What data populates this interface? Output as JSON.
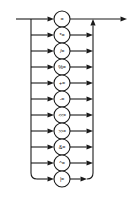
{
  "diagram": {
    "type": "railroad-syntax-diagram",
    "name": "assignment-operator",
    "geometry": {
      "width": 131,
      "height": 208,
      "entry_x": 16,
      "left_rail_x": 31,
      "node_center_x": 62,
      "node_radius": 8,
      "right_rail_x": 93,
      "exit_x": 127,
      "main_line_y": 19,
      "row_spacing": 16,
      "first_row_y": 19,
      "corner_radius": 6
    },
    "colors": {
      "background": "#ffffff",
      "line": "#1a1a1a",
      "node_fill": "#ffffff",
      "node_stroke": "#1a1a1a",
      "text": "#111111"
    },
    "entry_arrow": "arrow-right",
    "exit_arrow": "arrow-right",
    "merge_arrow": "arrow-up",
    "options": [
      {
        "label": "=",
        "row": 0,
        "y": 19,
        "wide": false
      },
      {
        "label": "*=",
        "row": 1,
        "y": 35,
        "wide": false
      },
      {
        "label": "/=",
        "row": 2,
        "y": 51,
        "wide": false
      },
      {
        "label": "%=",
        "row": 3,
        "y": 67,
        "wide": false
      },
      {
        "label": "+=",
        "row": 4,
        "y": 83,
        "wide": false
      },
      {
        "label": "-=",
        "row": 5,
        "y": 99,
        "wide": false
      },
      {
        "label": "<<=",
        "row": 6,
        "y": 115,
        "wide": true
      },
      {
        "label": ">>=",
        "row": 7,
        "y": 131,
        "wide": true
      },
      {
        "label": "&=",
        "row": 8,
        "y": 147,
        "wide": false
      },
      {
        "label": "^=",
        "row": 9,
        "y": 163,
        "wide": false
      },
      {
        "label": "|=",
        "row": 10,
        "y": 179,
        "wide": false
      }
    ]
  }
}
